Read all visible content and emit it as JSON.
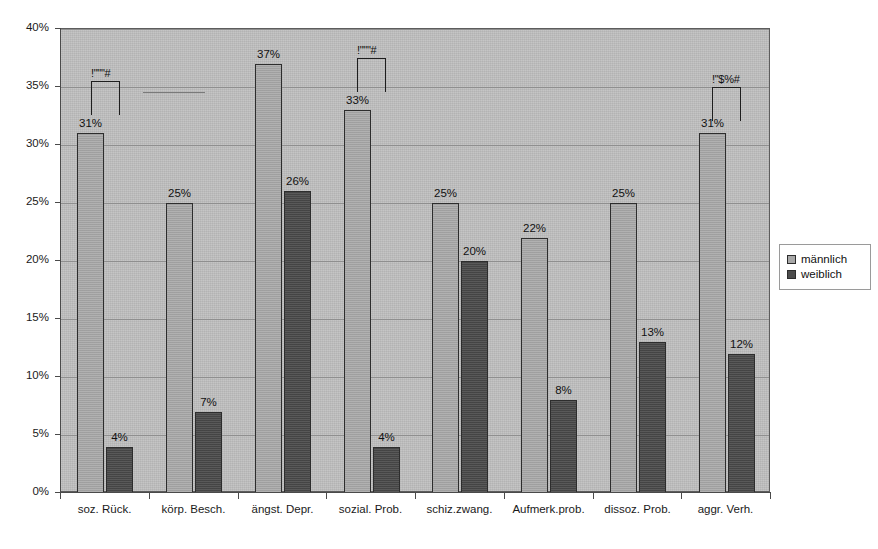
{
  "chart_data": {
    "type": "bar",
    "title": "",
    "subtitle": "",
    "xlabel": "",
    "ylabel": "",
    "ylim": [
      0,
      40
    ],
    "ytick_labels": [
      "0%",
      "5%",
      "10%",
      "15%",
      "20%",
      "25%",
      "30%",
      "35%",
      "40%"
    ],
    "ytick_values": [
      0,
      5,
      10,
      15,
      20,
      25,
      30,
      35,
      40
    ],
    "grid": true,
    "legend_position": "right",
    "categories": [
      "soz. Rück.",
      "körp. Besch.",
      "ängst. Depr.",
      "sozial. Prob.",
      "schiz.zwang.",
      "Aufmerk.prob.",
      "dissoz. Prob.",
      "aggr. Verh."
    ],
    "series": [
      {
        "name": "männlich",
        "color": "#a8a8a8",
        "values": [
          31,
          25,
          37,
          33,
          25,
          22,
          25,
          31
        ],
        "labels": [
          "31%",
          "25%",
          "37%",
          "33%",
          "25%",
          "22%",
          "25%",
          "31%"
        ]
      },
      {
        "name": "weiblich",
        "color": "#4c4c4c",
        "values": [
          4,
          7,
          26,
          4,
          20,
          8,
          13,
          12
        ],
        "labels": [
          "4%",
          "7%",
          "26%",
          "4%",
          "20%",
          "8%",
          "13%",
          "12%"
        ]
      }
    ],
    "annotations": [
      {
        "text": "!\"\"\"#",
        "category": "soz. Rück.",
        "y": 35.5
      },
      {
        "text": "!\"\"\"#",
        "category": "sozial. Prob.",
        "y": 37.5
      },
      {
        "text": "!\"$%#",
        "category": "aggr. Verh.",
        "y": 35.0
      }
    ],
    "plot_background": "#bfbfbf",
    "axis_color": "#4a4a4a",
    "gridline_color": "#8f8f8f"
  },
  "legend": {
    "items": [
      {
        "label": "männlich"
      },
      {
        "label": "weiblich"
      }
    ]
  }
}
